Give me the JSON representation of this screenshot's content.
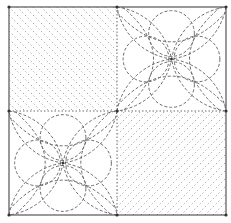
{
  "diagram": {
    "type": "quilt-block-pattern",
    "outer_square": {
      "x": 9,
      "y": 7,
      "w": 217,
      "h": 208
    },
    "center": {
      "x": 117,
      "y": 111
    },
    "colors": {
      "background": "#ffffff",
      "border": "#555555",
      "dashed_line": "#6a6a6a",
      "hatch_line": "#9a9a9a",
      "vertex_dot": "#333333"
    },
    "quadrants": [
      {
        "id": "top-left",
        "fill": "diagonal-hatch",
        "hatch_direction": "backslash",
        "spacing": 8
      },
      {
        "id": "top-right",
        "fill": "floral-circles",
        "center": {
          "x": 171,
          "y": 59
        }
      },
      {
        "id": "bottom-left",
        "fill": "floral-circles",
        "center": {
          "x": 63,
          "y": 163
        }
      },
      {
        "id": "bottom-right",
        "fill": "diagonal-hatch",
        "hatch_direction": "slash",
        "spacing": 8
      }
    ]
  }
}
